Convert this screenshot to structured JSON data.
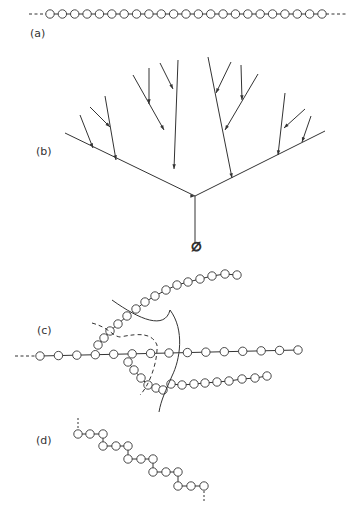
{
  "labels": {
    "a": "(a)",
    "b": "(b)",
    "c": "(c)",
    "d": "(d)"
  },
  "panel_b": {
    "root_symbol": "∅"
  },
  "panel_a": {
    "circle_count": 23
  },
  "colors": {
    "stroke": "#333333",
    "background": "#ffffff"
  }
}
